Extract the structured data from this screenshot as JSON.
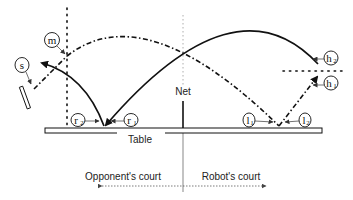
{
  "labels": {
    "net": "Net",
    "table": "Table",
    "opponent_court": "Opponent's court",
    "robot_court": "Robot's court"
  },
  "markers": {
    "m": {
      "base": "m",
      "sub": ""
    },
    "s": {
      "base": "s",
      "sub": ""
    },
    "r1": {
      "base": "r",
      "sub": "1"
    },
    "r2": {
      "base": "r",
      "sub": "2"
    },
    "l1": {
      "base": "l",
      "sub": "1"
    },
    "l2": {
      "base": "l",
      "sub": "2"
    },
    "h1": {
      "base": "h",
      "sub": "1"
    },
    "h2": {
      "base": "h",
      "sub": "2"
    }
  },
  "colors": {
    "ink": "#111111",
    "grey": "#888888",
    "table_fill": "#ffffff"
  }
}
